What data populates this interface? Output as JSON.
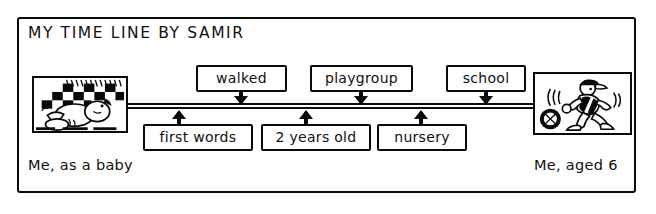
{
  "page": {
    "title": "MY TIME LINE BY SAMIR",
    "ink_color": "#0a0a0a",
    "paper_color": "#ffffff"
  },
  "timeline": {
    "style": "double-horizontal-rule",
    "above_events": [
      {
        "label": "walked",
        "arrow": "down-arrow-to-timeline"
      },
      {
        "label": "playgroup",
        "arrow": "down-arrow-to-timeline"
      },
      {
        "label": "school",
        "arrow": "down-arrow-to-timeline"
      }
    ],
    "below_events": [
      {
        "label": "first words",
        "arrow": "up-arrow-to-timeline"
      },
      {
        "label": "2 years old",
        "arrow": "up-arrow-to-timeline"
      },
      {
        "label": "nursery",
        "arrow": "up-arrow-to-timeline"
      }
    ]
  },
  "photos": {
    "start": {
      "alt": "baby lying on a checkered blanket",
      "caption": "Me, as a baby"
    },
    "end": {
      "alt": "boy running with a football",
      "caption": "Me, aged 6"
    }
  }
}
